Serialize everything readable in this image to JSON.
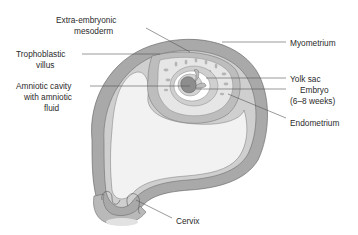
{
  "diagram": {
    "colors": {
      "myometrium": "#a9a9a9",
      "endometrium": "#cfcfcf",
      "cavity": "#f2f2f2",
      "villus_zone": "#e6e6e6",
      "embryo": "#8d8d8d",
      "outline": "#555555",
      "label_text": "#2b2b2b"
    },
    "labels": {
      "extra_embryonic_line1": "Extra-embryonic",
      "extra_embryonic_line2": "mesoderm",
      "trophoblastic_line1": "Trophoblastic",
      "trophoblastic_line2": "villus",
      "amniotic_line1": "Amniotic cavity",
      "amniotic_line2": "with amniotic",
      "amniotic_line3": "fluid",
      "myometrium": "Myometrium",
      "yolk_sac": "Yolk sac",
      "embryo_line1": "Embryo",
      "embryo_line2": "(6–8 weeks)",
      "endometrium": "Endometrium",
      "cervix": "Cervix"
    }
  }
}
